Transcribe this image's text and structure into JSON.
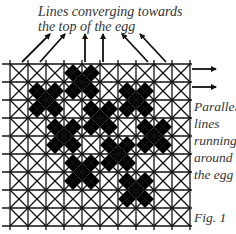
{
  "labels": {
    "top_line1": "Lines converging towards",
    "top_line2": "the top of the egg",
    "side_line1": "Parallel",
    "side_line2": "lines",
    "side_line3": "running",
    "side_line4": "around",
    "side_line5": "the egg",
    "figure": "Fig. 1"
  },
  "grid": {
    "x0": 10,
    "y0": 64,
    "cell": 18,
    "cols": 10,
    "rows": 9,
    "filled_crosses": [
      {
        "col": 4,
        "row": 1
      },
      {
        "col": 2,
        "row": 2
      },
      {
        "col": 7,
        "row": 2
      },
      {
        "col": 5,
        "row": 3
      },
      {
        "col": 3,
        "row": 4
      },
      {
        "col": 8,
        "row": 4
      },
      {
        "col": 6,
        "row": 5
      },
      {
        "col": 4,
        "row": 6
      },
      {
        "col": 7,
        "row": 7
      }
    ]
  },
  "arrows": {
    "converging": [
      {
        "x1": 22,
        "y1": 62,
        "x2": 50,
        "y2": 34
      },
      {
        "x1": 40,
        "y1": 62,
        "x2": 65,
        "y2": 34
      },
      {
        "x1": 85,
        "y1": 62,
        "x2": 85,
        "y2": 34
      },
      {
        "x1": 103,
        "y1": 62,
        "x2": 103,
        "y2": 34
      },
      {
        "x1": 148,
        "y1": 62,
        "x2": 122,
        "y2": 34
      },
      {
        "x1": 166,
        "y1": 62,
        "x2": 140,
        "y2": 34
      }
    ],
    "parallel": [
      {
        "x1": 192,
        "y1": 69,
        "x2": 216,
        "y2": 69
      },
      {
        "x1": 192,
        "y1": 87,
        "x2": 216,
        "y2": 87
      }
    ]
  }
}
